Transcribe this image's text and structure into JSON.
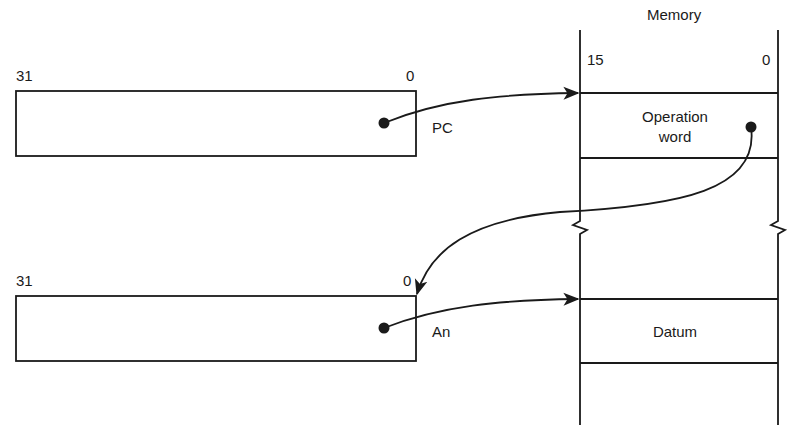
{
  "memory": {
    "title": "Memory",
    "bit_high": "15",
    "bit_low": "0",
    "cells": [
      {
        "label_line1": "Operation",
        "label_line2": "word"
      },
      {
        "label": "Datum"
      }
    ]
  },
  "registers": [
    {
      "name": "PC",
      "bit_high": "31",
      "bit_low": "0"
    },
    {
      "name": "An",
      "bit_high": "31",
      "bit_low": "0"
    }
  ],
  "colors": {
    "ink": "#1a1a1a",
    "background": "#ffffff"
  }
}
